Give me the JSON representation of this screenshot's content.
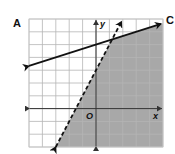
{
  "figure": {
    "labels": {
      "left_corner": "A",
      "right_corner": "C"
    },
    "axis_labels": {
      "x": "x",
      "y": "y",
      "origin": "O"
    },
    "colors": {
      "shade": "#a8a8a8",
      "grid": "#b5b5b5",
      "line": "#111111",
      "background": "#ffffff"
    }
  },
  "graph": {
    "type": "system_of_inequalities",
    "x_range": [
      -5,
      5
    ],
    "y_range": [
      -3,
      7
    ],
    "grid": true,
    "grid_step": 1,
    "boundaries": [
      {
        "name": "solid-line",
        "style": "solid",
        "equation": "y = (1/3)x + 5",
        "slope": 0.3333,
        "intercept": 5,
        "arrows": "both"
      },
      {
        "name": "dashed-line",
        "style": "dashed",
        "equation": "y = 2x + 3",
        "slope": 2,
        "intercept": 3,
        "arrows": "both"
      }
    ],
    "shaded_region": "below solid line and right of dashed line",
    "intersection": [
      1.2,
      5.4
    ]
  }
}
